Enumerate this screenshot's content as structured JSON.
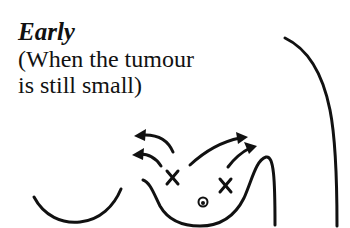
{
  "caption": {
    "title": "Early",
    "lines": [
      "(When the tumour",
      "is still small)"
    ]
  },
  "figure": {
    "markers": [
      {
        "type": "x-mark",
        "label": "tumour site left"
      },
      {
        "type": "x-mark",
        "label": "tumour site right"
      },
      {
        "type": "nipple",
        "label": "nipple"
      }
    ],
    "arrows": [
      {
        "direction": "upper-left"
      },
      {
        "direction": "upper-left"
      },
      {
        "direction": "upper-right"
      },
      {
        "direction": "upper-right"
      }
    ],
    "stroke_color": "#111111",
    "background_color": "#ffffff"
  }
}
